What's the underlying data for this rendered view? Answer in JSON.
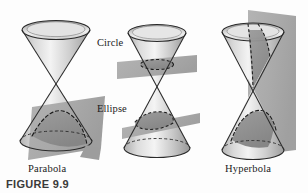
{
  "figure": {
    "caption": "FIGURE 9.9",
    "background_color": "#fdfdfd",
    "outline_color": "#1b1b1b",
    "plane_color": "#a8a8a8",
    "plane_color_dark": "#8e8e8e",
    "cone_light": "#f2f2f2",
    "cone_mid": "#c9c9c9",
    "cone_dark": "#9a9a9a",
    "cut_fill": "#8f8f8f"
  },
  "panels": [
    {
      "id": "parabola",
      "label": "Parabola",
      "plane_orientation": "tilted",
      "cone_type": "double-napped",
      "cut_curve": "parabola"
    },
    {
      "id": "circle-ellipse",
      "label": "",
      "plane_orientation": "horizontal-and-tilted",
      "cone_type": "double-napped",
      "cut_curve": "circle-and-ellipse"
    },
    {
      "id": "hyperbola",
      "label": "Hyperbola",
      "plane_orientation": "vertical",
      "cone_type": "double-napped",
      "cut_curve": "hyperbola"
    }
  ],
  "inline_labels": [
    {
      "id": "circle",
      "text": "Circle",
      "x": 97,
      "y": 46
    },
    {
      "id": "ellipse",
      "text": "Ellipse",
      "x": 97,
      "y": 112
    }
  ],
  "panel_labels": [
    {
      "id": "parabola",
      "text": "Parabola",
      "x": 28,
      "y": 172
    },
    {
      "id": "hyperbola",
      "text": "Hyperbola",
      "x": 225,
      "y": 172
    }
  ],
  "caption_position": {
    "x": 6,
    "y": 188
  }
}
